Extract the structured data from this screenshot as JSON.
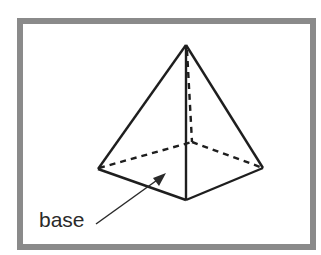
{
  "diagram": {
    "annotation_label": "base",
    "colors": {
      "frame": "#8a8a8a",
      "edge": "#1e1e1e",
      "background": "#ffffff"
    }
  }
}
